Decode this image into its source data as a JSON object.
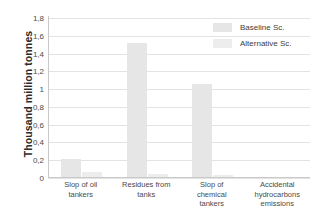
{
  "chart_data": {
    "type": "bar",
    "title": "",
    "xlabel": "",
    "ylabel": "Thousand million tonnes",
    "ylim": [
      0,
      1.8
    ],
    "yticks": [
      "1,8",
      "1,6",
      "1,4",
      "1,2",
      "1",
      "0,8",
      "0,6",
      "0,4",
      "0,2",
      "0"
    ],
    "ytick_values": [
      1.8,
      1.6,
      1.4,
      1.2,
      1.0,
      0.8,
      0.6,
      0.4,
      0.2,
      0
    ],
    "grid": true,
    "legend_position": "top-right",
    "categories": [
      "Slop of oil tankers",
      "Residues from tanks",
      "Slop of chemical tankers",
      "Accidental hydrocarbons emissions"
    ],
    "category_lines": [
      [
        "Slop of oil",
        "tankers"
      ],
      [
        "Residues from",
        "tanks"
      ],
      [
        "Slop of",
        "chemical",
        "tankers"
      ],
      [
        "Accidental",
        "hydrocarbons",
        "emissions"
      ]
    ],
    "series": [
      {
        "name": "Baseline Sc.",
        "color": "#e6e6e6",
        "values": [
          0.21,
          1.52,
          1.06,
          0.0
        ]
      },
      {
        "name": "Alternative Sc.",
        "color": "#ededed",
        "values": [
          0.07,
          0.045,
          0.035,
          0.0
        ]
      }
    ]
  },
  "colors": {
    "gridline": "#e3e3e3",
    "axis": "#c9c9c9",
    "tick_text": "#4a4a4a",
    "title_text": "#2b2b2b",
    "background": "#ffffff"
  }
}
